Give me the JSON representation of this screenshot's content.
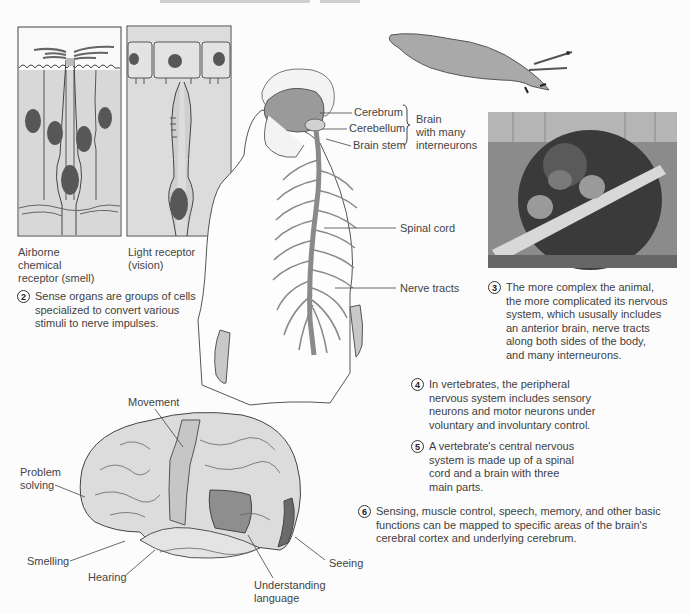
{
  "sense_organs": {
    "smell_label": [
      "Airborne",
      "chemical",
      "receptor (smell)"
    ],
    "vision_label": [
      "Light receptor",
      "(vision)"
    ]
  },
  "human_figure": {
    "labels": {
      "cerebrum": "Cerebrum",
      "cerebellum": "Cerebellum",
      "brain_stem": "Brain stem",
      "brain_group": [
        "Brain",
        "with many",
        "interneurons"
      ],
      "spinal_cord": "Spinal cord",
      "nerve_tracts": "Nerve tracts"
    }
  },
  "notes": [
    {
      "number": "2",
      "lines": [
        "Sense organs are groups of cells",
        "specialized to convert various",
        "stimuli to nerve impulses."
      ]
    },
    {
      "number": "3",
      "lines": [
        "The more complex the animal,",
        "the more complicated its nervous",
        "system, which ususally includes",
        "an anterior brain, nerve tracts",
        "along both sides of the body,",
        "and many interneurons."
      ]
    },
    {
      "number": "4",
      "lines": [
        "In vertebrates, the peripheral",
        "nervous system includes sensory",
        "neurons and motor neurons under",
        "voluntary and involuntary control."
      ]
    },
    {
      "number": "5",
      "lines": [
        "A vertebrate's central nervous",
        "system is made up of a spinal",
        "cord and a brain with three",
        "main parts."
      ]
    },
    {
      "number": "6",
      "lines": [
        "Sensing, muscle control, speech, memory, and other basic",
        "functions can be mapped to specific areas of the brain's",
        "cerebral cortex and underlying cerebrum."
      ]
    }
  ],
  "brain_map": {
    "labels": {
      "movement": "Movement",
      "problem_solving": [
        "Problem",
        "solving"
      ],
      "smelling": "Smelling",
      "hearing": "Hearing",
      "understanding_language": [
        "Understanding",
        "language"
      ],
      "seeing": "Seeing"
    }
  },
  "colors": {
    "background": "#fcfcfc",
    "tissue_light": "#d6d6d6",
    "tissue_mid": "#a8a8a8",
    "tissue_dark": "#6e6e6e",
    "nucleus": "#585858",
    "text": "#3f3f3f"
  }
}
